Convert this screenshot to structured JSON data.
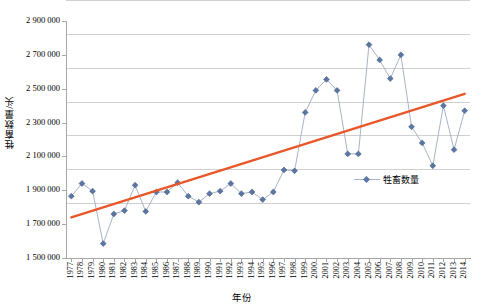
{
  "chart_data": {
    "type": "line",
    "title": "",
    "subtitle": "",
    "xlabel": "年份",
    "ylabel": "牲畜数量/头",
    "ylim": [
      1500000,
      2900000
    ],
    "ytick_values": [
      1500000,
      1700000,
      1900000,
      2100000,
      2300000,
      2500000,
      2700000,
      2900000
    ],
    "ytick_labels": [
      "1 500 000",
      "1 700 000",
      "1 900 000",
      "2 100 000",
      "2 300 000",
      "2 500 000",
      "2 700 000",
      "2 900 000"
    ],
    "grid": true,
    "legend_position": "inside-right",
    "categories": [
      "1977",
      "1978",
      "1979",
      "1980",
      "1981",
      "1982",
      "1983",
      "1984",
      "1985",
      "1986",
      "1987",
      "1988",
      "1989",
      "1990",
      "1991",
      "1992",
      "1993",
      "1994",
      "1995",
      "1996",
      "1997",
      "1998",
      "1999",
      "2000",
      "2001",
      "2002",
      "2003",
      "2004",
      "2005",
      "2006",
      "2007",
      "2008",
      "2009",
      "2010",
      "2011",
      "2012",
      "2013",
      "2014"
    ],
    "series": [
      {
        "name": "牲畜数量",
        "marker": "diamond",
        "color": "#5b76a4",
        "line_color": "#a9b3c6",
        "values": [
          1865000,
          1940000,
          1895000,
          1585000,
          1760000,
          1780000,
          1930000,
          1775000,
          1890000,
          1890000,
          1945000,
          1865000,
          1830000,
          1880000,
          1895000,
          1940000,
          1880000,
          1890000,
          1845000,
          1890000,
          2020000,
          2015000,
          2360000,
          2490000,
          2555000,
          2490000,
          2115000,
          2115000,
          2760000,
          2670000,
          2560000,
          2700000,
          2275000,
          2180000,
          2045000,
          2400000,
          2140000,
          2370000
        ]
      }
    ],
    "trendline": {
      "name": "线性趋势线",
      "color": "#e8572a",
      "start_value": 1740000,
      "end_value": 2470000
    }
  },
  "legend": {
    "entries": [
      {
        "label": "牲畜数量"
      }
    ]
  }
}
